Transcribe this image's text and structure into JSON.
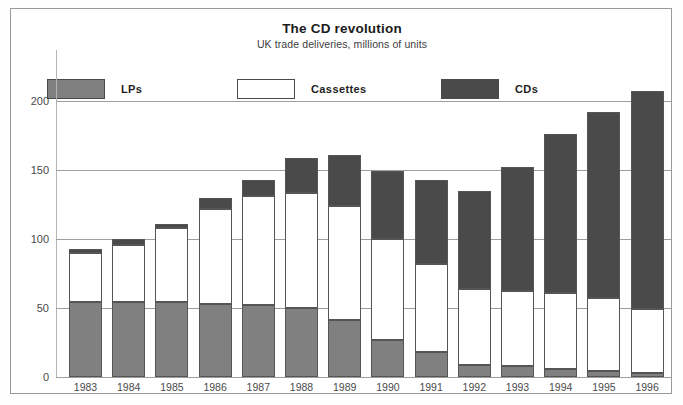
{
  "header": {
    "title": "The CD revolution",
    "subtitle": "UK trade deliveries, millions of units"
  },
  "legend": {
    "items": [
      {
        "label": "LPs",
        "color": "#808080",
        "key": "lps"
      },
      {
        "label": "Cassettes",
        "color": "#ffffff",
        "key": "cassettes"
      },
      {
        "label": "CDs",
        "color": "#4a4a4a",
        "key": "cds"
      }
    ]
  },
  "axis": {
    "y_ticks": [
      "0",
      "50",
      "100",
      "150",
      "200"
    ],
    "y_tick_values": [
      0,
      50,
      100,
      150,
      200
    ]
  },
  "chart_data": {
    "type": "bar",
    "subtype": "stacked-vertical",
    "title": "The CD revolution",
    "subtitle": "UK trade deliveries, millions of units",
    "xlabel": "",
    "ylabel": "millions of units",
    "ylim": [
      0,
      200
    ],
    "yticks": [
      0,
      50,
      100,
      150,
      200
    ],
    "grid": "horizontal",
    "legend_position": "top",
    "categories": [
      "1983",
      "1984",
      "1985",
      "1986",
      "1987",
      "1988",
      "1989",
      "1990",
      "1991",
      "1992",
      "1993",
      "1994",
      "1995",
      "1996"
    ],
    "series": [
      {
        "name": "LPs",
        "color": "#808080",
        "values": [
          54,
          54,
          54,
          53,
          52,
          50,
          41,
          27,
          18,
          9,
          8,
          6,
          4,
          3
        ]
      },
      {
        "name": "Cassettes",
        "color": "#ffffff",
        "values": [
          36,
          42,
          54,
          69,
          79,
          83,
          83,
          73,
          64,
          55,
          54,
          55,
          53,
          46
        ]
      },
      {
        "name": "CDs",
        "color": "#4a4a4a",
        "values": [
          3,
          4,
          3,
          8,
          12,
          26,
          37,
          49,
          61,
          71,
          90,
          115,
          135,
          158
        ]
      }
    ],
    "totals": [
      93,
      100,
      111,
      130,
      143,
      159,
      161,
      149,
      143,
      135,
      152,
      176,
      192,
      207
    ]
  }
}
